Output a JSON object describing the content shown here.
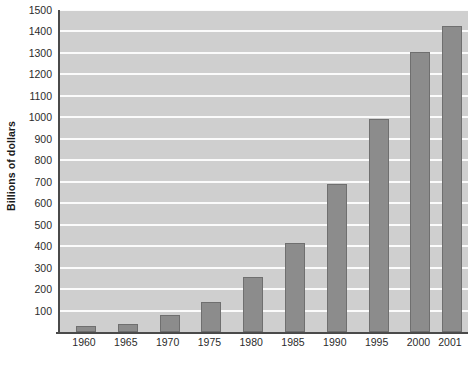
{
  "chart_data": {
    "type": "bar",
    "title": "",
    "xlabel": "",
    "ylabel": "Billions of dollars",
    "categories": [
      "1960",
      "1965",
      "1970",
      "1975",
      "1980",
      "1985",
      "1990",
      "1995",
      "2000",
      "2001"
    ],
    "values": [
      30,
      38,
      78,
      140,
      255,
      415,
      690,
      990,
      1305,
      1425
    ],
    "ylim": [
      0,
      1500
    ],
    "ytick_labels": [
      "1500",
      "1400",
      "1300",
      "1200",
      "1100",
      "1000",
      "900",
      "800",
      "700",
      "600",
      "500",
      "400",
      "300",
      "200",
      "100"
    ],
    "ytick_values": [
      1500,
      1400,
      1300,
      1200,
      1100,
      1000,
      900,
      800,
      700,
      600,
      500,
      400,
      300,
      200,
      100
    ],
    "grid": true,
    "legend": "none",
    "colors": {
      "bar_fill": "#8c8c8c",
      "bar_edge": "#6f6f6f",
      "plot_background": "#cfcfcf",
      "gridline": "#fbfbfb",
      "axis_line": "#4a4a4a",
      "tick_text": "#2b2b2b",
      "axis_title_text": "#1a1a1a",
      "page_background": "#ffffff"
    }
  },
  "caption": {
    "bottom_text": ""
  }
}
